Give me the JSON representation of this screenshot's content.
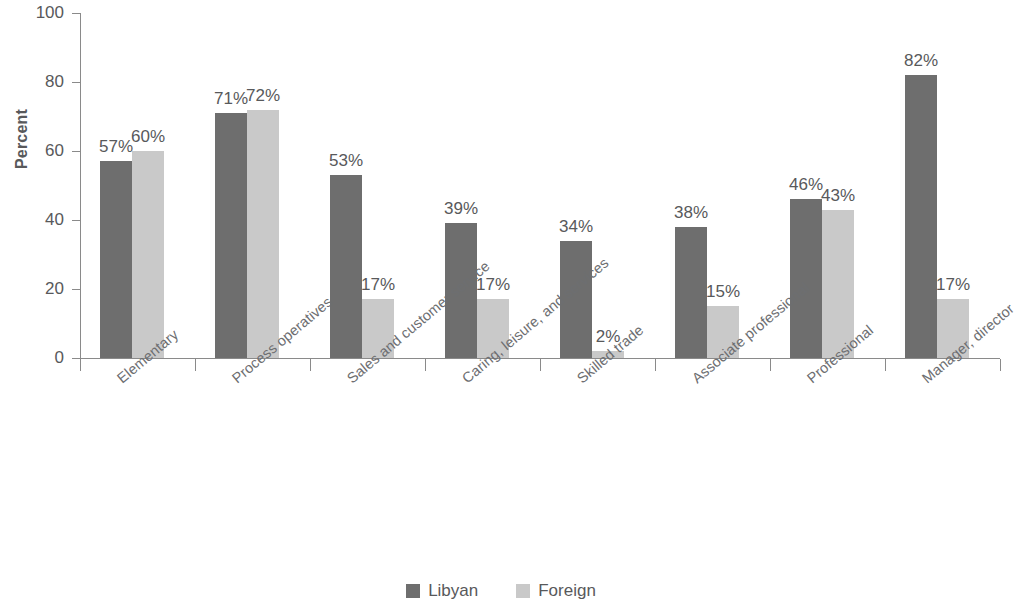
{
  "chart_data": {
    "type": "bar",
    "title": "",
    "subtitle": "",
    "xlabel": "",
    "ylabel": "Percent",
    "ylim": [
      0,
      100
    ],
    "yticks": [
      0,
      20,
      40,
      60,
      80,
      100
    ],
    "grid": false,
    "legend_position": "bottom-center",
    "orientation": "vertical",
    "grouping": "grouped",
    "value_suffix": "%",
    "categories": [
      "Elementary",
      "Process operatives",
      "Sales and customer service",
      "Caring, leisure, and services",
      "Skilled trade",
      "Associate professional",
      "Professional",
      "Manager, director"
    ],
    "series": [
      {
        "name": "Libyan",
        "color": "#6e6e6e",
        "values": [
          57,
          71,
          53,
          39,
          34,
          38,
          46,
          82
        ],
        "labels": [
          "57%",
          "71%",
          "53%",
          "39%",
          "34%",
          "38%",
          "46%",
          "82%"
        ]
      },
      {
        "name": "Foreign",
        "color": "#c9c9c9",
        "values": [
          60,
          72,
          17,
          17,
          2,
          15,
          43,
          17
        ],
        "labels": [
          "60%",
          "72%",
          "17%",
          "17%",
          "2%",
          "15%",
          "43%",
          "17%"
        ]
      }
    ]
  },
  "axis": {
    "y_title": "Percent",
    "y_tick_labels": [
      "0",
      "20",
      "40",
      "60",
      "80",
      "100"
    ]
  },
  "legend": {
    "items": [
      {
        "label": "Libyan",
        "color": "#6e6e6e",
        "swatch": "legend-swatch-dark"
      },
      {
        "label": "Foreign",
        "color": "#c9c9c9",
        "swatch": "legend-swatch-light"
      }
    ]
  },
  "colors": {
    "series_libyan": "#6e6e6e",
    "series_foreign": "#c9c9c9",
    "axis": "#8a8a8a",
    "text": "#58595b",
    "category_text": "#6d6e71",
    "background": "#ffffff"
  }
}
